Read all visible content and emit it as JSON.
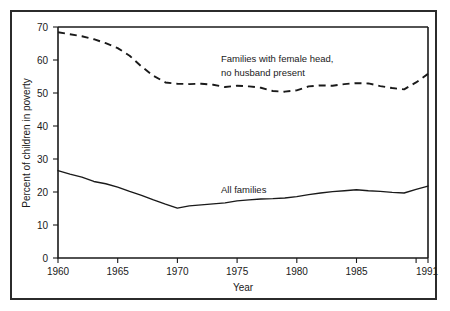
{
  "chart_data": {
    "type": "line",
    "title": "",
    "xlabel": "Year",
    "ylabel": "Percent of children in poverty",
    "xlim": [
      1960,
      1991
    ],
    "ylim": [
      0,
      70
    ],
    "grid": false,
    "legend_position": "inline-annotation",
    "y_ticks": [
      0,
      10,
      20,
      30,
      40,
      50,
      60,
      70
    ],
    "y_tick_labels": [
      "0",
      "10",
      "20",
      "30",
      "40",
      "50",
      "60",
      "70"
    ],
    "x_ticks": [
      1960,
      1965,
      1970,
      1975,
      1980,
      1985,
      1990,
      1991
    ],
    "x_tick_labels": [
      "1960",
      "1965",
      "1970",
      "1975",
      "1980",
      "1985",
      "",
      "1991"
    ],
    "series": [
      {
        "name": "Families with female head, no husband present",
        "style": "dashed",
        "annotation_lines": [
          "Families with female head,",
          "no husband present"
        ],
        "x": [
          1960,
          1961,
          1962,
          1963,
          1964,
          1965,
          1966,
          1967,
          1968,
          1969,
          1970,
          1971,
          1972,
          1973,
          1974,
          1975,
          1976,
          1977,
          1978,
          1979,
          1980,
          1981,
          1982,
          1983,
          1984,
          1985,
          1986,
          1987,
          1988,
          1989,
          1990,
          1991
        ],
        "values": [
          68.4,
          67.8,
          67.2,
          66.3,
          65.1,
          63.6,
          61.3,
          58.0,
          55.2,
          53.2,
          52.8,
          52.7,
          52.8,
          52.5,
          51.8,
          52.2,
          52.0,
          51.6,
          50.6,
          50.4,
          50.8,
          52.0,
          52.3,
          52.2,
          52.7,
          53.0,
          52.9,
          52.1,
          51.5,
          51.1,
          53.2,
          55.8
        ]
      },
      {
        "name": "All families",
        "style": "solid",
        "annotation_lines": [
          "All families"
        ],
        "x": [
          1960,
          1961,
          1962,
          1963,
          1964,
          1965,
          1966,
          1967,
          1968,
          1969,
          1970,
          1971,
          1972,
          1973,
          1974,
          1975,
          1976,
          1977,
          1978,
          1979,
          1980,
          1981,
          1982,
          1983,
          1984,
          1985,
          1986,
          1987,
          1988,
          1989,
          1990,
          1991
        ],
        "values": [
          26.5,
          25.4,
          24.5,
          23.2,
          22.5,
          21.5,
          20.2,
          19.0,
          17.6,
          16.3,
          15.1,
          15.8,
          16.1,
          16.4,
          16.7,
          17.3,
          17.6,
          17.9,
          18.0,
          18.2,
          18.6,
          19.2,
          19.7,
          20.1,
          20.4,
          20.7,
          20.4,
          20.2,
          19.9,
          19.7,
          20.8,
          21.8
        ]
      }
    ]
  },
  "annotations": {
    "female_head_line1": "Families with female head,",
    "female_head_line2": "no husband present",
    "all_families": "All families"
  },
  "axes": {
    "x_title": "Year",
    "y_title": "Percent of children in poverty"
  }
}
